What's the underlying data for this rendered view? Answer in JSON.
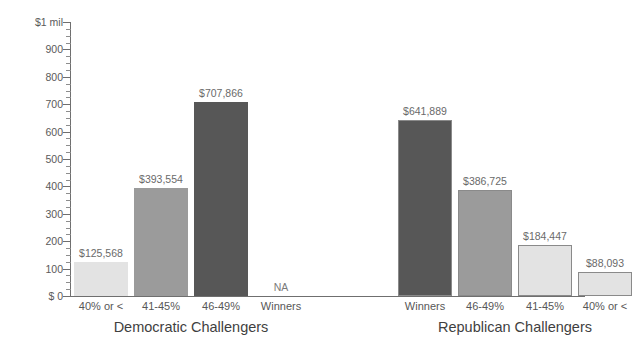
{
  "chart_data": {
    "type": "bar",
    "title": "",
    "subtitle": "",
    "xlabel": "",
    "ylabel": "",
    "ylim": [
      0,
      1000000
    ],
    "grid": false,
    "legend_position": "none",
    "y_axis": {
      "ticks": [
        {
          "value": 1000000,
          "label": "$1 mil"
        },
        {
          "value": 900000,
          "label": "900"
        },
        {
          "value": 800000,
          "label": "800"
        },
        {
          "value": 700000,
          "label": "700"
        },
        {
          "value": 600000,
          "label": "600"
        },
        {
          "value": 500000,
          "label": "500"
        },
        {
          "value": 400000,
          "label": "400"
        },
        {
          "value": 300000,
          "label": "300"
        },
        {
          "value": 200000,
          "label": "200"
        },
        {
          "value": 100000,
          "label": "100"
        },
        {
          "value": 0,
          "label": "$ 0"
        }
      ],
      "minor_tick_interval": 25000,
      "units": "dollars"
    },
    "groups": [
      {
        "name": "Democratic Challengers",
        "categories": [
          "40% or <",
          "41-45%",
          "46-49%",
          "Winners"
        ],
        "values": [
          125568,
          393554,
          707866,
          null
        ],
        "value_labels": [
          "$125,568",
          "$393,554",
          "$707,866",
          "NA"
        ],
        "shades": [
          "light",
          "mid",
          "dark",
          "none"
        ]
      },
      {
        "name": "Republican Challengers",
        "categories": [
          "Winners",
          "46-49%",
          "41-45%",
          "40% or <"
        ],
        "values": [
          641889,
          386725,
          184447,
          88093
        ],
        "value_labels": [
          "$641,889",
          "$386,725",
          "$184,447",
          "$88,093"
        ],
        "shades": [
          "dark",
          "mid",
          "light",
          "light"
        ]
      }
    ],
    "colors": {
      "light": "#e3e3e3",
      "mid": "#9b9b9b",
      "dark": "#575757",
      "axis": "#6f6f6f",
      "label": "#6a6a6a",
      "background": "#ffffff"
    }
  }
}
